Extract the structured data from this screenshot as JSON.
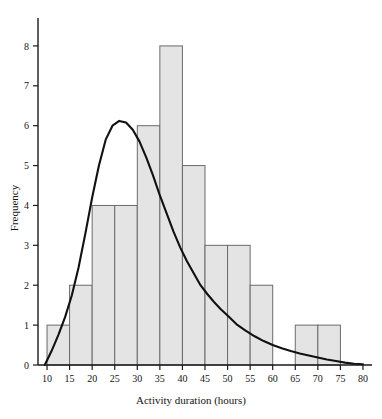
{
  "chart_data": {
    "type": "bar",
    "title": "",
    "subtitle": "",
    "xlabel": "Activity duration (hours)",
    "ylabel": "Frequency",
    "xlim": [
      8,
      82
    ],
    "ylim": [
      0,
      8.7
    ],
    "grid": false,
    "legend": null,
    "xticks": [
      10,
      15,
      20,
      25,
      30,
      35,
      40,
      45,
      50,
      55,
      60,
      65,
      70,
      75,
      80
    ],
    "yticks": [
      0,
      1,
      2,
      3,
      4,
      5,
      6,
      7,
      8
    ],
    "bin_width": 5,
    "bin_edges": [
      10,
      15,
      20,
      25,
      30,
      35,
      40,
      45,
      50,
      55,
      60,
      65,
      70,
      75
    ],
    "categories": [
      "10-15",
      "15-20",
      "20-25",
      "25-30",
      "30-35",
      "35-40",
      "40-45",
      "45-50",
      "50-55",
      "55-60",
      "60-65",
      "65-70",
      "70-75"
    ],
    "values": [
      1,
      2,
      4,
      4,
      6,
      8,
      5,
      3,
      3,
      2,
      0,
      1,
      1
    ],
    "bar_fill": "#e4e4e4",
    "bar_stroke": "#6b6b6b",
    "overlay_curve": {
      "name": "fitted density curve",
      "stroke": "#111111",
      "x": [
        9.5,
        11,
        12.5,
        14,
        15.5,
        17,
        18.5,
        20,
        21.5,
        23,
        24.5,
        26,
        27.5,
        29,
        30.5,
        32,
        33.5,
        35,
        36.5,
        38,
        39.5,
        41,
        42.5,
        44,
        45.5,
        47,
        48.5,
        50,
        52,
        54,
        56,
        58,
        60,
        62,
        64,
        66,
        68,
        70,
        72,
        74,
        76,
        78,
        80
      ],
      "y": [
        0.0,
        0.35,
        0.75,
        1.2,
        1.75,
        2.45,
        3.3,
        4.2,
        5.0,
        5.65,
        6.0,
        6.12,
        6.08,
        5.9,
        5.6,
        5.2,
        4.75,
        4.25,
        3.8,
        3.35,
        2.95,
        2.6,
        2.3,
        2.0,
        1.78,
        1.58,
        1.4,
        1.24,
        1.02,
        0.86,
        0.72,
        0.6,
        0.5,
        0.42,
        0.35,
        0.29,
        0.24,
        0.19,
        0.14,
        0.1,
        0.06,
        0.03,
        0.02
      ]
    }
  },
  "axes": {
    "x_tick_labels": [
      "10",
      "15",
      "20",
      "25",
      "30",
      "35",
      "40",
      "45",
      "50",
      "55",
      "60",
      "65",
      "70",
      "75",
      "80"
    ],
    "y_tick_labels": [
      "0",
      "1",
      "2",
      "3",
      "4",
      "5",
      "6",
      "7",
      "8"
    ],
    "x_title": "Activity duration (hours)",
    "y_title": "Frequency"
  }
}
